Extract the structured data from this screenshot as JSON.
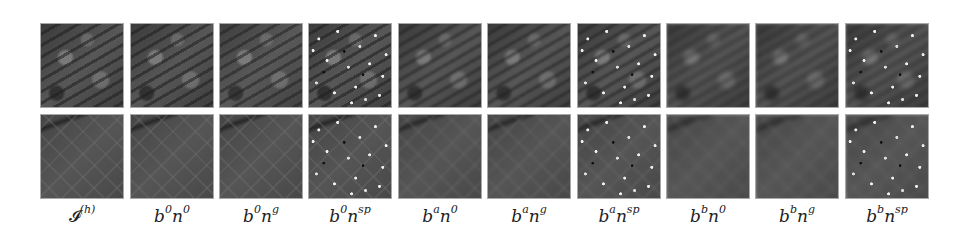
{
  "figure": {
    "rows": [
      "row-1",
      "row-2"
    ],
    "columns": [
      {
        "id": "original",
        "label_base": "𝓘",
        "label_sup": "(h)",
        "noise": "none",
        "blur": "none"
      },
      {
        "id": "b0n0",
        "label_b": "b",
        "label_b_sup": "0",
        "label_n": "n",
        "label_n_sup": "0",
        "blur": "0",
        "noise": "0"
      },
      {
        "id": "b0ng",
        "label_b": "b",
        "label_b_sup": "0",
        "label_n": "n",
        "label_n_sup": "g",
        "blur": "0",
        "noise": "g"
      },
      {
        "id": "b0nsp",
        "label_b": "b",
        "label_b_sup": "0",
        "label_n": "n",
        "label_n_sup": "sp",
        "blur": "0",
        "noise": "sp"
      },
      {
        "id": "ban0",
        "label_b": "b",
        "label_b_sup": "a",
        "label_n": "n",
        "label_n_sup": "0",
        "blur": "a",
        "noise": "0"
      },
      {
        "id": "bang",
        "label_b": "b",
        "label_b_sup": "a",
        "label_n": "n",
        "label_n_sup": "g",
        "blur": "a",
        "noise": "g"
      },
      {
        "id": "bansp",
        "label_b": "b",
        "label_b_sup": "a",
        "label_n": "n",
        "label_n_sup": "sp",
        "blur": "a",
        "noise": "sp"
      },
      {
        "id": "bbn0",
        "label_b": "b",
        "label_b_sup": "b",
        "label_n": "n",
        "label_n_sup": "0",
        "blur": "b",
        "noise": "0"
      },
      {
        "id": "bbng",
        "label_b": "b",
        "label_b_sup": "b",
        "label_n": "n",
        "label_n_sup": "g",
        "blur": "b",
        "noise": "g"
      },
      {
        "id": "bbnsp",
        "label_b": "b",
        "label_b_sup": "b",
        "label_n": "n",
        "label_n_sup": "sp",
        "blur": "b",
        "noise": "sp"
      }
    ]
  }
}
